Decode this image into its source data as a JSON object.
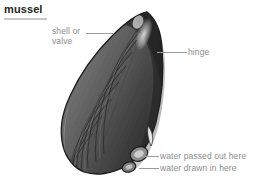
{
  "page": {
    "title": "mussel",
    "background_color": "#ffffff",
    "title_color": "#231f20",
    "rule_color": "#c9c9c9",
    "label_color": "#8c8c8c",
    "leader_color": "#9a9a9a"
  },
  "illustration": {
    "subject": "mussel-shell-engraving",
    "description": "grayscale engraved side view of a mussel shell with concentric growth rings",
    "shell_dark": "#2b2b2b",
    "shell_mid": "#6f6f6f",
    "shell_light": "#c8c8c8",
    "highlight": "#f0f0f0"
  },
  "labels": [
    {
      "id": "shell-or-valve",
      "text": "shell or\nvalve",
      "align": "left"
    },
    {
      "id": "hinge",
      "text": "hinge",
      "align": "left"
    },
    {
      "id": "water-passed-out-here",
      "text": "water passed out here",
      "align": "left"
    },
    {
      "id": "water-drawn-in-here",
      "text": "water drawn in here",
      "align": "left"
    }
  ]
}
